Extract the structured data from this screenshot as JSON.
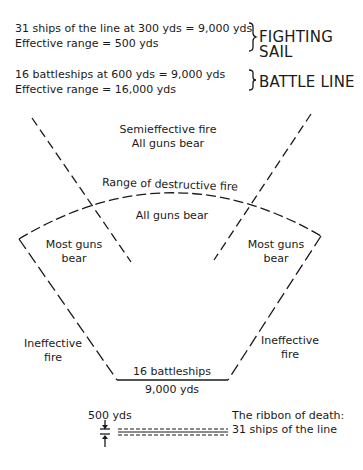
{
  "legend": {
    "fighting_sail": {
      "line1": "31 ships of the line at 300 yds = 9,000 yds",
      "line2": "Effective range = 500 yds",
      "label_line1": "FIGHTING",
      "label_line2": "SAIL"
    },
    "battle_line": {
      "line1": "16 battleships at 600 yds = 9,000 yds",
      "line2": "Effective range = 16,000 yds",
      "label": "BATTLE LINE"
    }
  },
  "zones": {
    "outer_line1": "Semieffective fire",
    "outer_line2": "All guns bear",
    "arc_label": "Range of destructive fire",
    "inner": "All guns bear",
    "left_mid_line1": "Most guns",
    "left_mid_line2": "bear",
    "right_mid_line1": "Most guns",
    "right_mid_line2": "bear",
    "left_low_line1": "Ineffective",
    "left_low_line2": "fire",
    "right_low_line1": "Ineffective",
    "right_low_line2": "fire"
  },
  "base": {
    "top_label": "16 battleships",
    "bottom_label": "9,000 yds"
  },
  "ribbon": {
    "range_label": "500 yds",
    "caption_line1": "The ribbon of death:",
    "caption_line2": "31 ships of the line"
  }
}
